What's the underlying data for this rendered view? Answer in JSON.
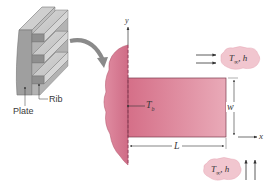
{
  "figure": {
    "inset": {
      "plate_label": "Plate",
      "rib_label": "Rib"
    },
    "fin": {
      "base_temp_label": "T",
      "base_temp_sub": "b",
      "length_label": "L",
      "width_label": "w"
    },
    "axes": {
      "x_label": "x",
      "y_label": "y"
    },
    "flow_top": {
      "temp_label": "T",
      "temp_sub": "∞",
      "coef_label": ", h",
      "direction": "rightward"
    },
    "flow_bottom": {
      "temp_label": "T",
      "temp_sub": "∞",
      "coef_label": ", h",
      "direction": "upward"
    },
    "colors": {
      "fin_fill": "#d9798f",
      "fin_fill_light": "#e6a3b2",
      "wall_fill": "#d47790",
      "cloud_fill": "#f1c6cf",
      "metal_gray": "#a9a9a9",
      "line": "#333333"
    }
  }
}
